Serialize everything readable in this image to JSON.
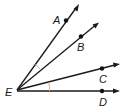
{
  "figure": {
    "vertex": {
      "label": "E",
      "x": 17,
      "y": 90
    },
    "rays": [
      {
        "label": "A",
        "point": [
          66,
          20
        ],
        "tip": [
          79,
          4
        ],
        "label_pos": [
          53,
          23
        ]
      },
      {
        "label": "B",
        "point": [
          81,
          36
        ],
        "tip": [
          98,
          23
        ],
        "label_pos": [
          77,
          50
        ]
      },
      {
        "label": "C",
        "point": [
          102,
          68
        ],
        "tip": [
          119,
          64
        ],
        "label_pos": [
          99,
          82
        ]
      },
      {
        "label": "D",
        "point": [
          102,
          91
        ],
        "tip": [
          119,
          91
        ],
        "label_pos": [
          99,
          106
        ]
      }
    ],
    "angle_marks": [
      {
        "between": [
          "EA",
          "EB"
        ],
        "type": "single-arc"
      },
      {
        "between": [
          "EC",
          "ED"
        ],
        "type": "single-arc"
      }
    ],
    "colors": {
      "line": "#1a1a1a",
      "arc": "#e0b48a",
      "background": "#ffffff"
    }
  },
  "labels": {
    "A": "A",
    "B": "B",
    "C": "C",
    "D": "D",
    "E": "E"
  }
}
